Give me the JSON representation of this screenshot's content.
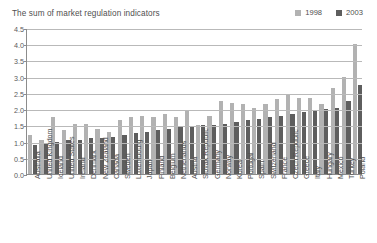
{
  "chart_data": {
    "type": "bar",
    "title": "The sum of market regulation indicators",
    "xlabel": "",
    "ylabel": "",
    "ylim": [
      0.0,
      4.5
    ],
    "ytick_labels": [
      "0.0",
      "0.5",
      "1.0",
      "1.5",
      "2.0",
      "2.5",
      "3.0",
      "3.5",
      "4.0",
      "4.5"
    ],
    "ytick_values": [
      0.0,
      0.5,
      1.0,
      1.5,
      2.0,
      2.5,
      3.0,
      3.5,
      4.0,
      4.5
    ],
    "grid": true,
    "legend_position": "top-right",
    "categories": [
      "Australia",
      "United Kingdom",
      "Iceland",
      "United States",
      "Ireland",
      "Denmark",
      "New Zealand",
      "Canada",
      "Sweden",
      "Luxembourg",
      "Japan",
      "Finland",
      "Belgium",
      "Netherlands",
      "Austria",
      "Slovak Republic",
      "Germany",
      "Norway",
      "Korea",
      "Portugal",
      "Spain",
      "Switzerland",
      "France",
      "Czech Republic",
      "Greece",
      "Italy",
      "Hungary",
      "Mexico",
      "Turkey",
      "Poland"
    ],
    "series": [
      {
        "name": "1998",
        "color": "#b2b2b2",
        "values": [
          1.2,
          1.05,
          1.75,
          1.35,
          1.55,
          1.55,
          1.4,
          1.3,
          1.65,
          1.75,
          1.8,
          1.75,
          1.85,
          1.75,
          1.95,
          1.5,
          1.8,
          2.25,
          2.2,
          2.15,
          2.05,
          2.15,
          2.3,
          2.45,
          2.35,
          2.35,
          2.15,
          2.65,
          3.0,
          4.0
        ]
      },
      {
        "name": "2003",
        "color": "#5e5e5e",
        "values": [
          0.9,
          0.95,
          1.0,
          1.05,
          1.05,
          1.1,
          1.1,
          1.15,
          1.2,
          1.25,
          1.3,
          1.35,
          1.4,
          1.45,
          1.45,
          1.5,
          1.5,
          1.55,
          1.6,
          1.65,
          1.7,
          1.75,
          1.8,
          1.85,
          1.9,
          1.95,
          2.0,
          2.05,
          2.25,
          2.75
        ]
      }
    ]
  },
  "legend": {
    "items": [
      {
        "label": "1998",
        "color": "#b2b2b2"
      },
      {
        "label": "2003",
        "color": "#5e5e5e"
      }
    ]
  }
}
